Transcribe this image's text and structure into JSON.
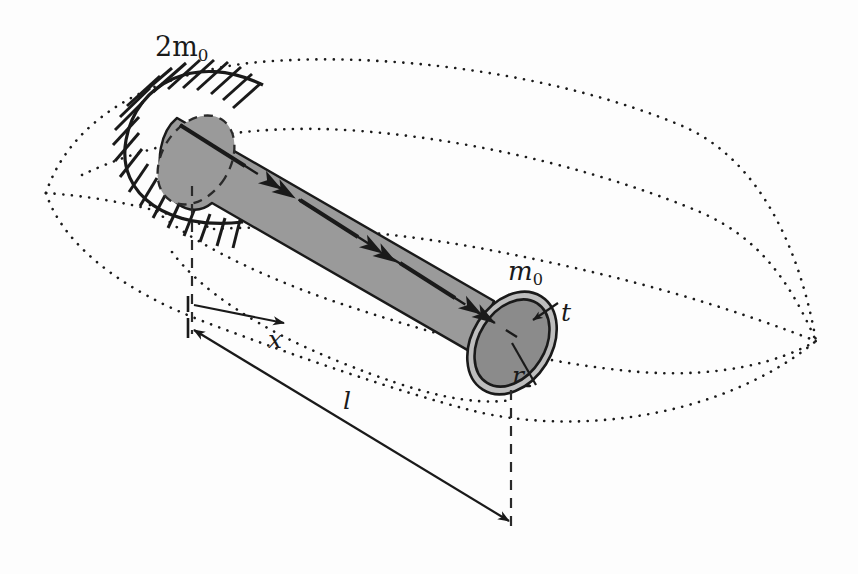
{
  "figure": {
    "kind": "engineering-diagram",
    "background_color": "#fdfdfd",
    "ink_color": "#1a1a1a",
    "tube_fill": "#9a9a9a",
    "tube_end_fill": "#8b8b8b",
    "tube_ring_fill": "#bdbdbd"
  },
  "labels": {
    "fixed_end_mass": {
      "text": "2m",
      "sub": "0",
      "x": 155,
      "y": 33
    },
    "free_end_mass": {
      "text": "m",
      "sub": "0",
      "x": 508,
      "y": 258
    },
    "thickness": {
      "text": "t",
      "x": 561,
      "y": 300
    },
    "radius": {
      "text": "r",
      "x": 512,
      "y": 363
    },
    "coordinate_x": {
      "text": "x",
      "x": 268,
      "y": 327
    },
    "length_l": {
      "text": "l",
      "x": 343,
      "y": 388
    }
  },
  "dimensions": {
    "x_arrow": {
      "from": [
        195,
        318
      ],
      "to": [
        282,
        322
      ],
      "style": "double-headed",
      "label": "x"
    },
    "l_arrow": {
      "from": [
        193,
        334
      ],
      "to": [
        510,
        522
      ],
      "style": "double-headed",
      "label": "l"
    },
    "extension_line_left": {
      "x": 192,
      "y1": 186,
      "y2": 334,
      "style": "dashed"
    },
    "extension_line_right": {
      "x": 511,
      "y1": 390,
      "y2": 527,
      "style": "dashed"
    }
  },
  "geometry": {
    "axis_start": [
      180,
      125
    ],
    "axis_end": [
      520,
      340
    ],
    "tube_angle_deg": 32,
    "near_end_center": [
      196,
      160
    ],
    "near_end_rx": 34,
    "near_end_ry": 48,
    "far_end_center": [
      512,
      343
    ],
    "far_end_rx_outer": 40,
    "far_end_ry_outer": 55,
    "far_end_rx_inner": 33,
    "far_end_ry_inner": 47,
    "torque_arrowheads": 3
  },
  "support": {
    "type": "fixed-end-hatching",
    "hatch_count": 18,
    "description": "short diagonal hatch strokes around the built-in left end"
  },
  "contours": {
    "style": "dotted",
    "description": "lens-shaped deformation reference surface outlines",
    "left_cusp": [
      46,
      193
    ],
    "right_cusp": [
      816,
      341
    ],
    "curve_count": 5
  }
}
